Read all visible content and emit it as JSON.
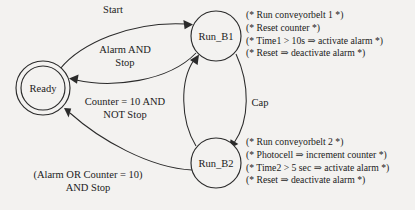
{
  "diagram": {
    "type": "state-transition-diagram",
    "background_color": "#f3f2f0",
    "ink_color": "#2b2b2b",
    "states": [
      {
        "id": "ready",
        "label": "Ready",
        "shape": "double-circle",
        "cx": 43,
        "cy": 88,
        "r_outer": 27,
        "r_inner": 22
      },
      {
        "id": "run_b1",
        "label": "Run_B1",
        "shape": "circle",
        "cx": 216,
        "cy": 36,
        "r_outer": 25
      },
      {
        "id": "run_b2",
        "label": "Run_B2",
        "shape": "circle",
        "cx": 216,
        "cy": 163,
        "r_outer": 25
      }
    ],
    "transitions": [
      {
        "id": "t1",
        "from": "ready",
        "to": "run_b1",
        "label": "Start"
      },
      {
        "id": "t2",
        "from": "run_b1",
        "to": "ready",
        "label": "Alarm AND\nStop",
        "line1": "Alarm AND",
        "line2": "Stop"
      },
      {
        "id": "t3",
        "from": "run_b2",
        "to": "run_b1",
        "label": "Counter = 10 AND\nNOT Stop",
        "line1": "Counter = 10 AND",
        "line2": "NOT Stop"
      },
      {
        "id": "t4",
        "from": "run_b1",
        "to": "run_b2",
        "label": "Cap"
      },
      {
        "id": "t5",
        "from": "run_b2",
        "to": "ready",
        "label": "(Alarm OR Counter = 10)\nAND Stop",
        "line1": "(Alarm OR Counter = 10)",
        "line2": "AND Stop"
      }
    ],
    "annotations": [
      {
        "id": "run_b1_actions",
        "for_state": "run_b1",
        "lines": [
          "(* Run conveyorbelt 1 *)",
          "(* Reset counter *)",
          "(* Time1 > 10s ⇒ activate alarm *)",
          "(* Reset ⇒ deactivate alarm *)"
        ]
      },
      {
        "id": "run_b2_actions",
        "for_state": "run_b2",
        "lines": [
          "(* Run conveyorbelt 2 *)",
          "(* Photocell ⇒ increment counter *)",
          "(* Time2 > 5 sec ⇒ activate alarm *)",
          "(* Reset ⇒ deactivate alarm *)"
        ]
      }
    ]
  }
}
